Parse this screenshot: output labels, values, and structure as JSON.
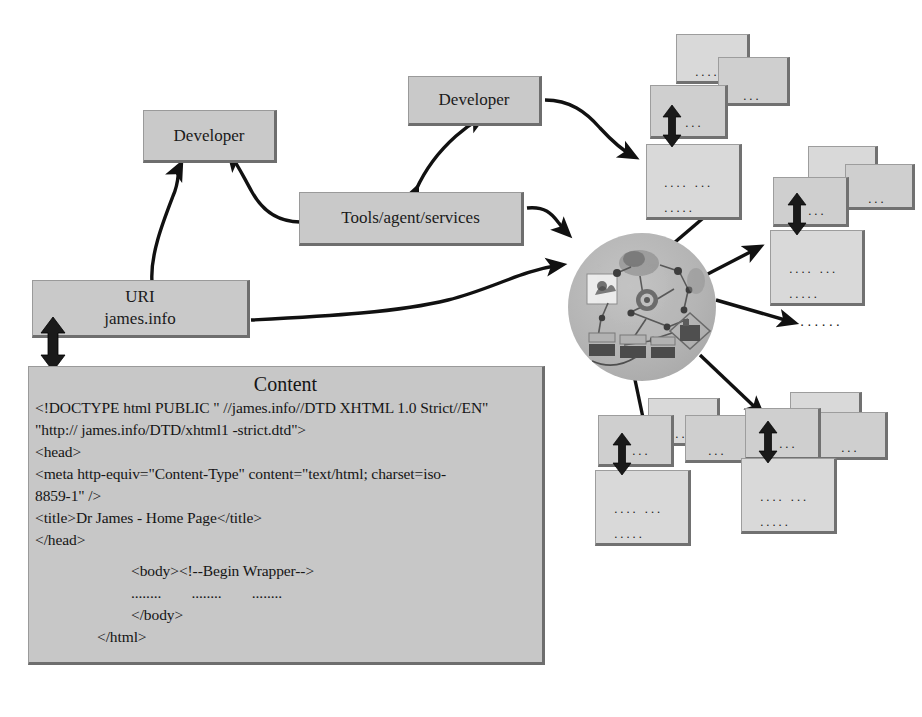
{
  "diagram": {
    "colors": {
      "box_fill": "#c9c9c9",
      "box_fill_light": "#d2d2d2",
      "box_edge": "#6e6e6e",
      "sphere_fill": "#b4b4b4",
      "arrow": "#111111",
      "page_background": "#ffffff",
      "text": "#151515"
    }
  },
  "nodes": {
    "developer_left": {
      "label": "Developer"
    },
    "developer_top": {
      "label": "Developer"
    },
    "tools": {
      "label": "Tools/agent/services"
    },
    "uri": {
      "line1": "URI",
      "line2": "james.info"
    },
    "sphere": {
      "label": "resource-network-sphere"
    }
  },
  "content_panel": {
    "title": "Content",
    "lines": [
      {
        "text": "<!DOCTYPE html PUBLIC \" //james.info//DTD XHTML 1.0 Strict//EN\"",
        "indent": 0
      },
      {
        "text": "\"http:// james.info/DTD/xhtml1 -strict.dtd\">",
        "indent": 0
      },
      {
        "text": "<head>",
        "indent": 0
      },
      {
        "text": "<meta http-equiv=\"Content-Type\" content=\"text/html; charset=iso-",
        "indent": 0
      },
      {
        "text": "8859-1\" />",
        "indent": 0
      },
      {
        "text": "<title>Dr James - Home Page</title>",
        "indent": 0
      },
      {
        "text": "</head>",
        "indent": 0
      },
      {
        "text": "<body><!--Begin Wrapper-->",
        "indent": 1
      },
      {
        "text": "........        ........        ........",
        "indent": 1
      },
      {
        "text": "</body>",
        "indent": 1
      },
      {
        "text": "</html>",
        "indent": 2
      }
    ]
  },
  "document_clusters": [
    {
      "name": "cluster-top-right",
      "cards": [
        {
          "dots": "....."
        },
        {
          "dots": "..."
        },
        {
          "dots": "..."
        },
        {
          "dots_line1": ".... ...",
          "dots_line2": "....."
        }
      ]
    },
    {
      "name": "cluster-right",
      "cards": [
        {
          "dots": "....."
        },
        {
          "dots": "..."
        },
        {
          "dots": "..."
        },
        {
          "dots_line1": ".... ...",
          "dots_line2": "....."
        }
      ]
    },
    {
      "name": "cluster-bottom-left",
      "cards": [
        {
          "dots": "....."
        },
        {
          "dots": "..."
        },
        {
          "dots": "..."
        },
        {
          "dots_line1": ".... ...",
          "dots_line2": "....."
        }
      ]
    },
    {
      "name": "cluster-bottom-right",
      "cards": [
        {
          "dots": "....."
        },
        {
          "dots": "..."
        },
        {
          "dots": "..."
        },
        {
          "dots_line1": ".... ...",
          "dots_line2": "....."
        }
      ]
    }
  ],
  "mid_ellipsis": {
    "text": "......"
  },
  "connections": [
    {
      "from": "content",
      "to": "uri",
      "style": "double-headed-vertical"
    },
    {
      "from": "uri",
      "to": "developer_left",
      "style": "curved-single"
    },
    {
      "from": "tools",
      "to": "developer_left",
      "style": "curved-single"
    },
    {
      "from": "tools",
      "to": "developer_top",
      "style": "curved-double"
    },
    {
      "from": "tools",
      "to": "sphere",
      "style": "curved-single"
    },
    {
      "from": "uri",
      "to": "sphere",
      "style": "curved-single"
    },
    {
      "from": "developer_top",
      "to": "cluster-top-right",
      "style": "curved-single"
    },
    {
      "from": "sphere",
      "to": "cluster-top-right",
      "style": "straight"
    },
    {
      "from": "sphere",
      "to": "cluster-right",
      "style": "straight"
    },
    {
      "from": "sphere",
      "to": "mid_ellipsis",
      "style": "straight"
    },
    {
      "from": "sphere",
      "to": "cluster-bottom-left",
      "style": "straight"
    },
    {
      "from": "sphere",
      "to": "cluster-bottom-right",
      "style": "straight"
    }
  ]
}
